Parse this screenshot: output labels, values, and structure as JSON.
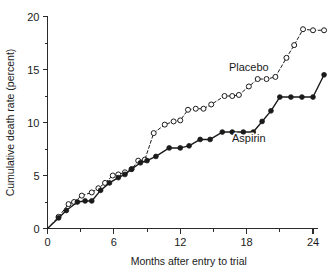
{
  "chart_data": {
    "type": "line",
    "title": "",
    "xlabel": "Months after entry to trial",
    "ylabel": "Cumulative death rate (percent)",
    "xlim": [
      0,
      25.6
    ],
    "ylim": [
      0,
      20
    ],
    "xticks": [
      0,
      6,
      12,
      18,
      24
    ],
    "yticks": [
      0,
      5,
      10,
      15,
      20
    ],
    "xticklabels": [
      "0",
      "6",
      "12",
      "18",
      "24"
    ],
    "yticklabels": [
      "0",
      "5",
      "10",
      "15",
      "20"
    ],
    "x_minor_ticks": [
      3,
      9,
      15,
      21
    ],
    "y_minor_ticks": [
      2.5,
      7.5,
      12.5,
      17.5
    ],
    "grid": false,
    "legend": "inline-annotations",
    "series": [
      {
        "name": "Placebo",
        "marker": "open-circle",
        "linestyle": "dashed",
        "color": "#1a1a1a",
        "label_position": {
          "x": 18.2,
          "y": 14.9
        },
        "points": [
          {
            "x": 0.0,
            "y": 0.0
          },
          {
            "x": 1.0,
            "y": 1.1
          },
          {
            "x": 1.9,
            "y": 2.3
          },
          {
            "x": 2.4,
            "y": 2.5
          },
          {
            "x": 3.1,
            "y": 3.1
          },
          {
            "x": 4.0,
            "y": 3.4
          },
          {
            "x": 4.6,
            "y": 3.8
          },
          {
            "x": 5.2,
            "y": 4.3
          },
          {
            "x": 5.9,
            "y": 5.0
          },
          {
            "x": 6.4,
            "y": 5.1
          },
          {
            "x": 7.0,
            "y": 5.3
          },
          {
            "x": 7.6,
            "y": 5.6
          },
          {
            "x": 8.2,
            "y": 6.4
          },
          {
            "x": 8.8,
            "y": 6.5
          },
          {
            "x": 9.6,
            "y": 9.0
          },
          {
            "x": 10.6,
            "y": 9.8
          },
          {
            "x": 11.4,
            "y": 10.1
          },
          {
            "x": 12.0,
            "y": 10.2
          },
          {
            "x": 12.7,
            "y": 11.2
          },
          {
            "x": 13.4,
            "y": 11.3
          },
          {
            "x": 14.1,
            "y": 11.3
          },
          {
            "x": 14.8,
            "y": 11.7
          },
          {
            "x": 16.0,
            "y": 12.5
          },
          {
            "x": 16.7,
            "y": 12.5
          },
          {
            "x": 17.3,
            "y": 12.6
          },
          {
            "x": 18.2,
            "y": 13.4
          },
          {
            "x": 19.0,
            "y": 14.1
          },
          {
            "x": 19.8,
            "y": 14.1
          },
          {
            "x": 20.6,
            "y": 14.3
          },
          {
            "x": 21.6,
            "y": 16.1
          },
          {
            "x": 22.3,
            "y": 17.3
          },
          {
            "x": 23.1,
            "y": 18.8
          },
          {
            "x": 24.0,
            "y": 18.7
          },
          {
            "x": 25.0,
            "y": 18.7
          }
        ]
      },
      {
        "name": "Aspirin",
        "marker": "filled-circle",
        "linestyle": "solid",
        "color": "#1a1a1a",
        "label_position": {
          "x": 18.2,
          "y": 8.2
        },
        "points": [
          {
            "x": 0.0,
            "y": 0.0
          },
          {
            "x": 1.0,
            "y": 1.0
          },
          {
            "x": 1.7,
            "y": 1.7
          },
          {
            "x": 2.7,
            "y": 2.5
          },
          {
            "x": 3.4,
            "y": 2.6
          },
          {
            "x": 4.0,
            "y": 2.6
          },
          {
            "x": 4.8,
            "y": 3.6
          },
          {
            "x": 5.6,
            "y": 4.3
          },
          {
            "x": 6.4,
            "y": 4.8
          },
          {
            "x": 7.0,
            "y": 5.1
          },
          {
            "x": 7.6,
            "y": 5.6
          },
          {
            "x": 8.4,
            "y": 6.2
          },
          {
            "x": 9.0,
            "y": 6.4
          },
          {
            "x": 9.8,
            "y": 6.8
          },
          {
            "x": 11.0,
            "y": 7.6
          },
          {
            "x": 12.0,
            "y": 7.6
          },
          {
            "x": 12.8,
            "y": 7.8
          },
          {
            "x": 13.8,
            "y": 8.4
          },
          {
            "x": 14.7,
            "y": 8.4
          },
          {
            "x": 15.8,
            "y": 9.1
          },
          {
            "x": 16.7,
            "y": 9.1
          },
          {
            "x": 17.7,
            "y": 9.1
          },
          {
            "x": 18.6,
            "y": 9.1
          },
          {
            "x": 19.4,
            "y": 10.1
          },
          {
            "x": 20.2,
            "y": 11.1
          },
          {
            "x": 21.0,
            "y": 12.4
          },
          {
            "x": 22.0,
            "y": 12.4
          },
          {
            "x": 23.0,
            "y": 12.4
          },
          {
            "x": 24.0,
            "y": 12.4
          },
          {
            "x": 25.0,
            "y": 14.5
          }
        ]
      }
    ]
  }
}
